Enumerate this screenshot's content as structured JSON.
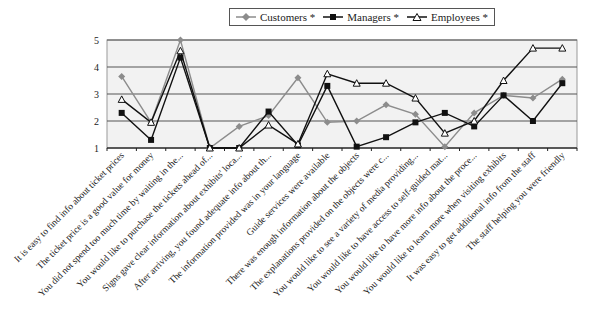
{
  "chart_data": {
    "type": "line",
    "title": "",
    "xlabel": "",
    "ylabel": "",
    "ylim": [
      1,
      5
    ],
    "yticks": [
      1,
      2,
      3,
      4,
      5
    ],
    "grid": true,
    "legend_position": "top",
    "categories": [
      "It is easy to find info about ticket prices",
      "The ticket price is a good value for money",
      "You did not spend too much time by waiting in the...",
      "You would like to purchase the tickets ahead of...",
      "Signs gave clear information about exhibits' loca...",
      "After arriving, you found adequate info about th...",
      "The information provided was in your language",
      "Guide services were available",
      "There was enough information about the objects",
      "The explanations provided on the objects were c...",
      "You would like to see a variety of media providing...",
      "You would like to have access to self-guided mat...",
      "You would like to have more info about the proce...",
      "You would like to learn more when visiting exhibits",
      "It was easy to get additional info from the staff",
      "The staff helping you were friendly"
    ],
    "series": [
      {
        "name": "Customers *",
        "color": "#8c8c8c",
        "marker": "diamond",
        "values": [
          3.65,
          1.95,
          5.0,
          1.0,
          1.8,
          2.2,
          3.6,
          1.95,
          2.0,
          2.6,
          2.25,
          1.05,
          2.3,
          2.95,
          2.85,
          3.55
        ]
      },
      {
        "name": "Managers *",
        "color": "#111111",
        "marker": "square",
        "values": [
          2.3,
          1.3,
          4.35,
          1.0,
          1.0,
          2.35,
          1.1,
          3.3,
          1.05,
          1.4,
          1.95,
          2.3,
          1.8,
          2.95,
          2.0,
          3.4
        ]
      },
      {
        "name": "Employees *",
        "color": "#111111",
        "marker": "triangle-open",
        "values": [
          2.8,
          1.95,
          4.6,
          1.0,
          1.0,
          1.85,
          1.15,
          3.75,
          3.4,
          3.4,
          2.85,
          1.55,
          2.0,
          3.5,
          4.7,
          4.7
        ]
      }
    ]
  },
  "legend": {
    "items": [
      "Customers *",
      "Managers *",
      "Employees *"
    ]
  },
  "style": {
    "plot_bg": "#f2f2f2",
    "grid_color": "#555555"
  }
}
